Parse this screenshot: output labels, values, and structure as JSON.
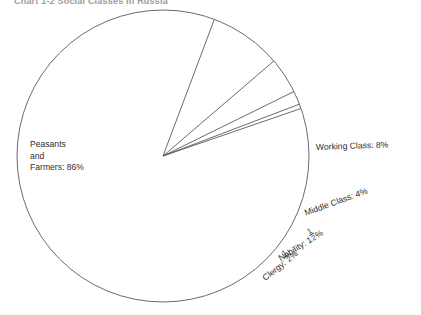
{
  "chart_data": {
    "type": "pie",
    "title": "Chart 1-2   Social Classes in Russia",
    "categories": [
      "Peasants and Farmers",
      "Working Class",
      "Middle Class",
      "Nobility",
      "Clergy"
    ],
    "values": [
      86,
      8,
      4,
      1.5,
      0.5
    ],
    "value_labels": [
      "86%",
      "8%",
      "4%",
      "1½%",
      "½%"
    ],
    "legend": "none",
    "grid": false,
    "xlabel": "",
    "ylabel": "",
    "start_angle_deg": -19,
    "direction": "clockwise",
    "fill_color": "#ffffff",
    "stroke_color": "#5a5a5a"
  },
  "title": {
    "text": "Chart 1-2   Social Classes in Russia"
  },
  "labels": {
    "peasants": {
      "line1": "Peasants",
      "line2": "and",
      "line3": "Farmers:  86%"
    },
    "working": {
      "text": "Working Class: 8%"
    },
    "middle": {
      "text": "Middle Class: 4%"
    },
    "nobility": {
      "prefix": "Nobility: 1",
      "num": "1",
      "den": "2",
      "suffix": "%"
    },
    "clergy": {
      "prefix": "Clergy: ",
      "num": "1",
      "den": "2",
      "suffix": "%"
    }
  }
}
